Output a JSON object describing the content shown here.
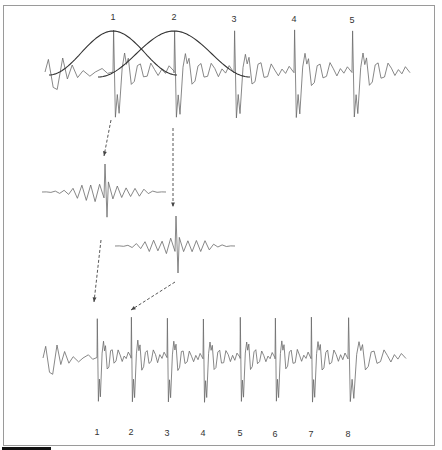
{
  "figure": {
    "top_signal": {
      "pitch_marks": [
        {
          "label": "1",
          "x": 113
        },
        {
          "label": "2",
          "x": 174
        },
        {
          "label": "3",
          "x": 234
        },
        {
          "label": "4",
          "x": 294
        },
        {
          "label": "5",
          "x": 352
        }
      ],
      "window_count": 2
    },
    "extracted_segments": [
      {
        "id": "segment-1",
        "center_x": 104,
        "center_y": 192
      },
      {
        "id": "segment-2",
        "center_x": 175,
        "center_y": 245
      }
    ],
    "bottom_signal": {
      "pitch_marks": [
        {
          "label": "1",
          "x": 97
        },
        {
          "label": "2",
          "x": 131
        },
        {
          "label": "3",
          "x": 167
        },
        {
          "label": "4",
          "x": 203
        },
        {
          "label": "5",
          "x": 240
        },
        {
          "label": "6",
          "x": 275
        },
        {
          "label": "7",
          "x": 311
        },
        {
          "label": "8",
          "x": 348
        }
      ]
    },
    "colors": {
      "signal": "#6a6a6a",
      "window": "#333333",
      "arrow": "#444444",
      "frame": "#9a9a9a",
      "scalebar": "#111111"
    }
  }
}
